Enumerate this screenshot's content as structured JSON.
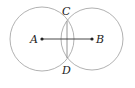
{
  "diagram": {
    "colors": {
      "circle": "#a8a8a8",
      "segment": "#333333",
      "chord": "#888888",
      "point": "#222222"
    },
    "circles": [
      {
        "name": "circle-A",
        "cx": 42,
        "cy": 39,
        "r": 32
      },
      {
        "name": "circle-B",
        "cx": 92,
        "cy": 39,
        "r": 31
      }
    ],
    "points": {
      "A": {
        "label": "A",
        "x": 42,
        "y": 39
      },
      "B": {
        "label": "B",
        "x": 92,
        "y": 39
      },
      "C": {
        "label": "C",
        "x": 67,
        "y": 21
      },
      "D": {
        "label": "D",
        "x": 67,
        "y": 58
      }
    }
  }
}
